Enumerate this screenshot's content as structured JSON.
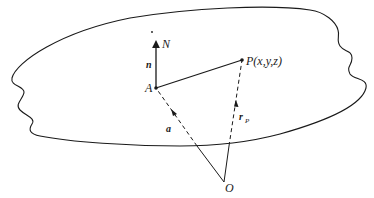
{
  "diagram": {
    "labels": {
      "N": "N",
      "n": "n",
      "A": "A",
      "P": "P(x,y,z)",
      "a": "a",
      "r": "r",
      "r_sub": "P",
      "O": "O"
    },
    "points": {
      "A": [
        156,
        88
      ],
      "P": [
        242,
        60
      ],
      "O": [
        224,
        182
      ],
      "N_tip": [
        156,
        43
      ]
    },
    "colors": {
      "stroke": "#1a1a1a",
      "background": "#ffffff"
    }
  }
}
